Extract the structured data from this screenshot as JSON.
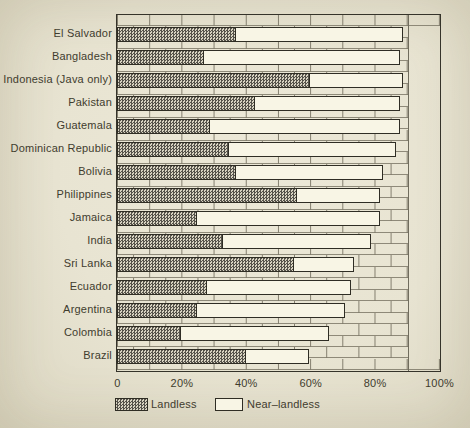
{
  "chart_data": {
    "type": "bar",
    "orientation": "horizontal",
    "stacked": true,
    "categories": [
      "El Salvador",
      "Bangladesh",
      "Indonesia (Java only)",
      "Pakistan",
      "Guatemala",
      "Dominican Republic",
      "Bolivia",
      "Philippines",
      "Jamaica",
      "India",
      "Sri Lanka",
      "Ecuador",
      "Argentina",
      "Colombia",
      "Brazil"
    ],
    "series": [
      {
        "name": "Landless",
        "values": [
          37,
          27,
          60,
          43,
          29,
          35,
          37,
          56,
          25,
          33,
          55,
          28,
          25,
          20,
          40
        ]
      },
      {
        "name": "Near-landless",
        "values": [
          52,
          61,
          29,
          45,
          59,
          52,
          46,
          26,
          57,
          46,
          19,
          45,
          46,
          46,
          20
        ]
      }
    ],
    "stacked_totals": [
      89,
      88,
      89,
      88,
      88,
      87,
      83,
      82,
      82,
      79,
      74,
      73,
      71,
      66,
      60
    ],
    "title": "",
    "xlabel": "",
    "ylabel": "",
    "xlim": [
      0,
      100
    ],
    "x_ticks": {
      "values": [
        0,
        20,
        40,
        60,
        80,
        100
      ],
      "labels": [
        "0",
        "20%",
        "40%",
        "60%",
        "80%",
        "100%"
      ]
    },
    "legend_position": "bottom",
    "grid": "brick-wall background pattern extending to 90%"
  },
  "legend": {
    "landless_label": "Landless",
    "near_landless_label": "Near–landless"
  },
  "colors": {
    "paper": "#e8e4d2",
    "bar_fill": "#f8f5e5",
    "hatch_base": "#d8d3c1",
    "hatch_dot": "#55524a",
    "ink": "#2f2d24",
    "mortar_line": "#76715f",
    "text": "#3f3c2e"
  }
}
